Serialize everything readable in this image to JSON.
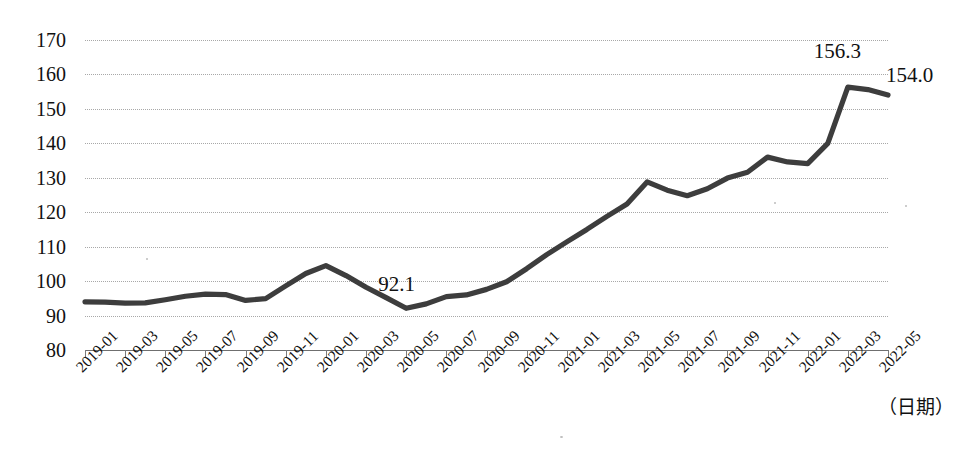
{
  "chart_data": {
    "type": "line",
    "title": "",
    "xlabel": "（日期）",
    "ylabel": "",
    "ylim": [
      80,
      170
    ],
    "ytick_step": 10,
    "yticks": [
      170,
      160,
      150,
      140,
      130,
      120,
      110,
      100,
      90,
      80
    ],
    "grid": true,
    "legend": "none",
    "line_color": "#3d3d3d",
    "x": [
      "2019-01",
      "2019-02",
      "2019-03",
      "2019-04",
      "2019-05",
      "2019-06",
      "2019-07",
      "2019-08",
      "2019-09",
      "2019-10",
      "2019-11",
      "2019-12",
      "2020-01",
      "2020-02",
      "2020-03",
      "2020-04",
      "2020-05",
      "2020-06",
      "2020-07",
      "2020-08",
      "2020-09",
      "2020-10",
      "2020-11",
      "2020-12",
      "2021-01",
      "2021-02",
      "2021-03",
      "2021-04",
      "2021-05",
      "2021-06",
      "2021-07",
      "2021-08",
      "2021-09",
      "2021-10",
      "2021-11",
      "2021-12",
      "2022-01",
      "2022-02",
      "2022-03",
      "2022-04",
      "2022-05"
    ],
    "values": [
      94.0,
      93.9,
      93.6,
      93.7,
      94.6,
      95.6,
      96.2,
      96.1,
      94.4,
      94.9,
      98.6,
      102.2,
      104.5,
      101.6,
      98.2,
      95.2,
      92.1,
      93.4,
      95.5,
      96.0,
      97.6,
      99.8,
      103.6,
      107.7,
      111.4,
      115.0,
      118.8,
      122.4,
      128.8,
      126.4,
      124.8,
      126.8,
      129.9,
      131.6,
      136.0,
      134.6,
      134.1,
      140.0,
      156.3,
      155.6,
      154.0
    ],
    "xtick_labels": [
      "2019-01",
      "2019-03",
      "2019-05",
      "2019-07",
      "2019-09",
      "2019-11",
      "2020-01",
      "2020-03",
      "2020-05",
      "2020-07",
      "2020-09",
      "2020-11",
      "2021-01",
      "2021-03",
      "2021-05",
      "2021-07",
      "2021-09",
      "2021-11",
      "2022-01",
      "2022-03",
      "2022-05"
    ],
    "annotations": [
      {
        "label": "92.1",
        "point": "2020-05",
        "value": 92.1
      },
      {
        "label": "156.3",
        "point": "2022-03",
        "value": 156.3
      },
      {
        "label": "154.0",
        "point": "2022-05",
        "value": 154.0
      }
    ]
  }
}
